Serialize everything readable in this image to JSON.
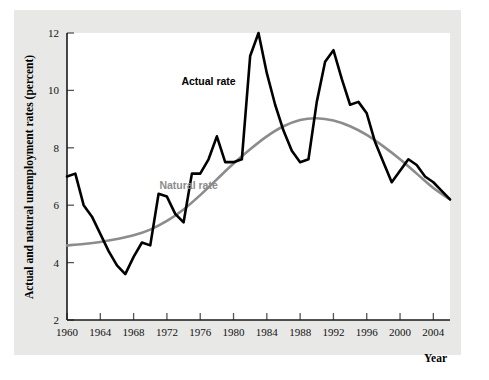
{
  "figure": {
    "background_color": "#ffffff",
    "panel_color": "#e8e8e6",
    "plot_color": "#ffffff"
  },
  "chart_data": {
    "type": "line",
    "title": "",
    "xlabel": "Year",
    "ylabel": "Actual and natural unemployment rates (percent)",
    "xlim": [
      1960,
      2006
    ],
    "ylim": [
      2,
      12
    ],
    "grid": false,
    "legend_position": "inline-annotation",
    "xticks": [
      1960,
      1964,
      1968,
      1972,
      1976,
      1980,
      1984,
      1988,
      1992,
      1996,
      2000,
      2004
    ],
    "xtick_labels": [
      "1960",
      "1964",
      "1968",
      "1972",
      "1976",
      "1980",
      "1984",
      "1988",
      "1992",
      "1996",
      "2000",
      "2004"
    ],
    "yticks": [
      2,
      4,
      6,
      8,
      10,
      12
    ],
    "ytick_labels": [
      "2",
      "4",
      "6",
      "8",
      "10",
      "12"
    ],
    "series": [
      {
        "name": "Actual rate",
        "color": "#000000",
        "width": 2.6,
        "label_x": 1977.0,
        "label_y": 10.2,
        "x": [
          1960,
          1961,
          1962,
          1963,
          1964,
          1965,
          1966,
          1967,
          1968,
          1969,
          1970,
          1971,
          1972,
          1973,
          1974,
          1975,
          1976,
          1977,
          1978,
          1979,
          1980,
          1981,
          1982,
          1983,
          1984,
          1985,
          1986,
          1987,
          1988,
          1989,
          1990,
          1991,
          1992,
          1993,
          1994,
          1995,
          1996,
          1997,
          1998,
          1999,
          2000,
          2001,
          2002,
          2003,
          2004,
          2005,
          2006
        ],
        "values": [
          7.0,
          7.1,
          6.0,
          5.6,
          5.0,
          4.4,
          3.9,
          3.6,
          4.2,
          4.7,
          4.6,
          6.4,
          6.3,
          5.7,
          5.4,
          7.1,
          7.1,
          7.6,
          8.4,
          7.5,
          7.5,
          7.6,
          11.2,
          12.0,
          10.6,
          9.5,
          8.6,
          7.9,
          7.5,
          7.6,
          9.6,
          11.0,
          11.4,
          10.4,
          9.5,
          9.6,
          9.2,
          8.2,
          7.5,
          6.8,
          7.2,
          7.6,
          7.4,
          7.0,
          6.8,
          6.5,
          6.2
        ]
      },
      {
        "name": "Natural rate",
        "color": "#8c8c8c",
        "width": 2.6,
        "label_x": 1974.6,
        "label_y": 6.55,
        "x": [
          1960,
          1962,
          1964,
          1966,
          1968,
          1970,
          1972,
          1974,
          1976,
          1978,
          1980,
          1982,
          1984,
          1986,
          1988,
          1990,
          1992,
          1994,
          1996,
          1998,
          2000,
          2002,
          2004,
          2006
        ],
        "values": [
          4.6,
          4.65,
          4.72,
          4.82,
          4.95,
          5.15,
          5.45,
          5.85,
          6.35,
          6.9,
          7.45,
          7.95,
          8.4,
          8.75,
          8.97,
          9.03,
          8.95,
          8.75,
          8.45,
          8.05,
          7.6,
          7.1,
          6.6,
          6.2
        ]
      }
    ]
  }
}
